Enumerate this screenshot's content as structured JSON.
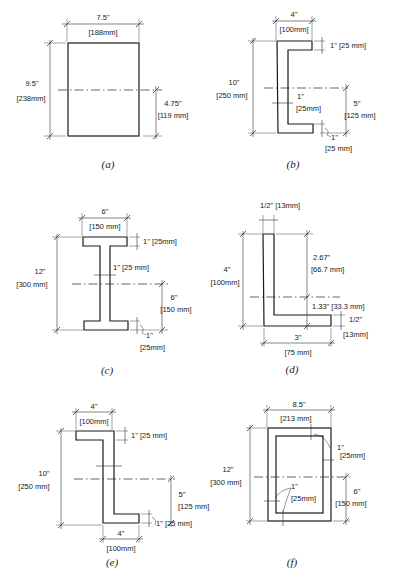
{
  "figures": [
    {
      "id": "a",
      "caption": "(a)",
      "shape": "rectangle",
      "width_label": "7.5\"",
      "width_mm": "[188mm]",
      "height_label": "9.5\"",
      "height_mm": "[238mm]",
      "centroid_label": "4.75\"",
      "centroid_mm": "[119 mm]"
    },
    {
      "id": "b",
      "caption": "(b)",
      "shape": "channel",
      "width_label": "4\"",
      "width_mm": "[100mm]",
      "flange_label": "1\" [25 mm]",
      "height_label": "10\"",
      "height_mm": "[250 mm]",
      "web_label": "1\"",
      "web_mm": "[25mm]",
      "centroid_label": "5\"",
      "centroid_mm": "[125 mm]",
      "bottom_flange_label": "1\"",
      "bottom_flange_mm": "[25 mm]"
    },
    {
      "id": "c",
      "caption": "(c)",
      "shape": "i-beam",
      "width_label": "6\"",
      "width_mm": "[150 mm]",
      "flange_label": "1\" [25mm]",
      "height_label": "12\"",
      "height_mm": "[300 mm]",
      "web_label": "1\" [25 mm]",
      "centroid_label": "6\"",
      "centroid_mm": "[150 mm]",
      "bottom_flange_label": "1\"",
      "bottom_flange_mm": "[25mm]"
    },
    {
      "id": "d",
      "caption": "(d)",
      "shape": "angle",
      "thickness_label": "1/2\" [13mm]",
      "height_label": "4\"",
      "height_mm": "[100mm]",
      "upper_label": "2.67\"",
      "upper_mm": "[66.7 mm]",
      "centroid_label": "1.33\" [33.3 mm]",
      "leg_thickness_label": "1/2\"",
      "leg_thickness_mm": "[13mm]",
      "width_label": "3\"",
      "width_mm": "[75 mm]"
    },
    {
      "id": "e",
      "caption": "(e)",
      "shape": "z-section",
      "top_width_label": "4\"",
      "top_width_mm": "[100mm]",
      "flange_label": "1\" [25 mm]",
      "height_label": "10\"",
      "height_mm": "[250 mm]",
      "centroid_label": "5\"",
      "centroid_mm": "[125 mm]",
      "bottom_flange_label": "1\" [25 mm]",
      "bottom_width_label": "4\"",
      "bottom_width_mm": "[100mm]"
    },
    {
      "id": "f",
      "caption": "(f)",
      "shape": "box",
      "width_label": "8.5\"",
      "width_mm": "[213 mm]",
      "height_label": "12\"",
      "height_mm": "[300 mm]",
      "wall_top_label": "1\"",
      "wall_top_mm": "[25mm]",
      "wall_left_label": "1\"",
      "wall_left_mm": "[25mm]",
      "centroid_label": "6\"",
      "centroid_mm": "[150 mm]"
    }
  ]
}
